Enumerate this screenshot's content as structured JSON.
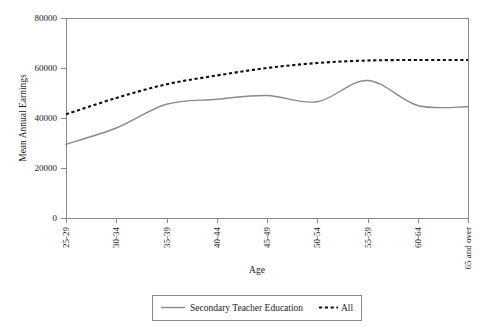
{
  "chart_data": {
    "type": "line",
    "title": "",
    "xlabel": "Age",
    "ylabel": "Mean Annual Earnings",
    "categories": [
      "25-29",
      "30-34",
      "35-39",
      "40-44",
      "45-49",
      "50-54",
      "55-59",
      "60-64",
      "65 and over"
    ],
    "yticks": [
      "0",
      "20000",
      "40000",
      "60000",
      "80000"
    ],
    "ylim": [
      0,
      80000
    ],
    "grid": false,
    "legend_position": "bottom",
    "series": [
      {
        "name": "Secondary Teacher Education",
        "style": "solid",
        "color": "#8a8a8a",
        "values": [
          29500,
          36000,
          45500,
          47500,
          49000,
          46500,
          55000,
          45000,
          44500
        ]
      },
      {
        "name": "All",
        "style": "dashed",
        "color": "#111111",
        "values": [
          41500,
          48000,
          53500,
          57000,
          60000,
          62000,
          63000,
          63200,
          63200
        ]
      }
    ]
  },
  "axes": {
    "y_label": "Mean Annual Earnings",
    "x_label": "Age",
    "y_tick_0": "0",
    "y_tick_1": "20000",
    "y_tick_2": "40000",
    "y_tick_3": "60000",
    "y_tick_4": "80000",
    "x_tick_0": "25-29",
    "x_tick_1": "30-34",
    "x_tick_2": "35-39",
    "x_tick_3": "40-44",
    "x_tick_4": "45-49",
    "x_tick_5": "50-54",
    "x_tick_6": "55-59",
    "x_tick_7": "60-64",
    "x_tick_8": "65 and over"
  },
  "legend": {
    "item_solid_label": "Secondary Teacher Education",
    "item_dashed_label": "All"
  }
}
